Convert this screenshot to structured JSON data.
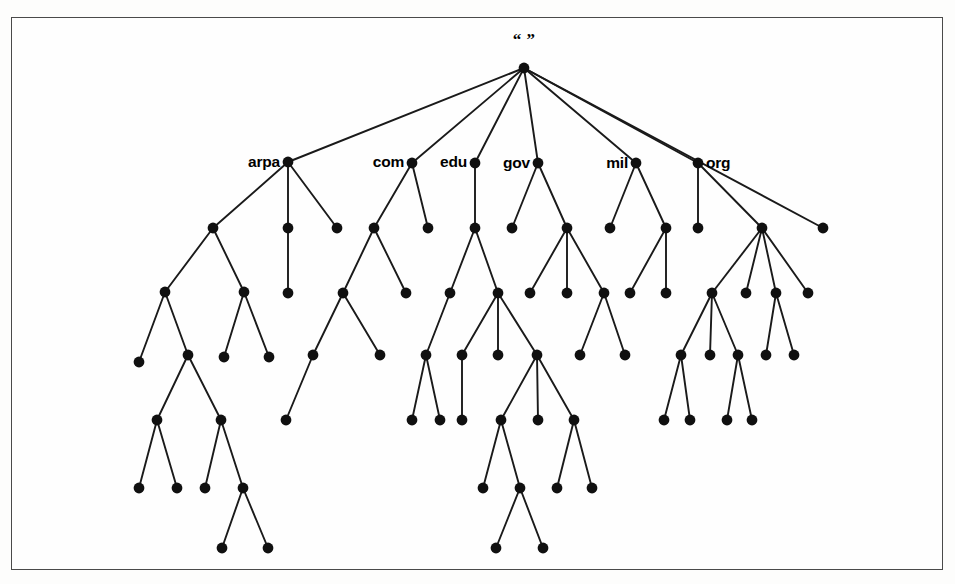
{
  "figure": {
    "root_label": "“ ”",
    "node_radius": 5.4,
    "node_color": "#101010",
    "edge_color": "#1a1a1a",
    "frame_color": "#4a4a4a",
    "background": "#fefefe"
  },
  "labels": [
    {
      "text": "arpa",
      "x": 280,
      "y": 167,
      "anchor": "end",
      "node": "tld-arpa"
    },
    {
      "text": "com",
      "x": 404,
      "y": 167,
      "anchor": "end",
      "node": "tld-com"
    },
    {
      "text": "edu",
      "x": 467,
      "y": 167,
      "anchor": "end",
      "node": "tld-edu"
    },
    {
      "text": "gov",
      "x": 530,
      "y": 168,
      "anchor": "end",
      "node": "tld-gov"
    },
    {
      "text": "mil",
      "x": 628,
      "y": 168,
      "anchor": "end",
      "node": "tld-mil"
    },
    {
      "text": "org",
      "x": 706,
      "y": 168,
      "anchor": "start",
      "node": "tld-org"
    }
  ],
  "root_label_pos": {
    "x": 524,
    "y": 45
  },
  "nodes": [
    {
      "id": "root",
      "x": 524,
      "y": 68,
      "name": "root-node"
    },
    {
      "id": "arpa",
      "x": 288,
      "y": 162,
      "name": "tld-arpa"
    },
    {
      "id": "com",
      "x": 412,
      "y": 163,
      "name": "tld-com"
    },
    {
      "id": "edu",
      "x": 475,
      "y": 163,
      "name": "tld-edu"
    },
    {
      "id": "gov",
      "x": 538,
      "y": 163,
      "name": "tld-gov"
    },
    {
      "id": "mil",
      "x": 636,
      "y": 163,
      "name": "tld-mil"
    },
    {
      "id": "org",
      "x": 698,
      "y": 163,
      "name": "tld-org"
    },
    {
      "id": "a1",
      "x": 213,
      "y": 228,
      "name": "tree-node"
    },
    {
      "id": "a2",
      "x": 288,
      "y": 228,
      "name": "tree-node"
    },
    {
      "id": "a3",
      "x": 337,
      "y": 228,
      "name": "tree-node"
    },
    {
      "id": "c1",
      "x": 374,
      "y": 228,
      "name": "tree-node"
    },
    {
      "id": "c2",
      "x": 428,
      "y": 228,
      "name": "tree-node"
    },
    {
      "id": "e1",
      "x": 475,
      "y": 228,
      "name": "tree-node"
    },
    {
      "id": "g1",
      "x": 512,
      "y": 228,
      "name": "tree-node"
    },
    {
      "id": "g2",
      "x": 567,
      "y": 228,
      "name": "tree-node"
    },
    {
      "id": "m1",
      "x": 610,
      "y": 228,
      "name": "tree-node"
    },
    {
      "id": "m2",
      "x": 666,
      "y": 228,
      "name": "tree-node"
    },
    {
      "id": "o1",
      "x": 698,
      "y": 228,
      "name": "tree-node"
    },
    {
      "id": "o2",
      "x": 762,
      "y": 228,
      "name": "tree-node"
    },
    {
      "id": "o3",
      "x": 823,
      "y": 228,
      "name": "tree-node"
    },
    {
      "id": "b1",
      "x": 165,
      "y": 292,
      "name": "tree-node"
    },
    {
      "id": "b2",
      "x": 244,
      "y": 292,
      "name": "tree-node"
    },
    {
      "id": "b3",
      "x": 288,
      "y": 293,
      "name": "tree-node"
    },
    {
      "id": "b4",
      "x": 343,
      "y": 293,
      "name": "tree-node"
    },
    {
      "id": "b5",
      "x": 406,
      "y": 293,
      "name": "tree-node"
    },
    {
      "id": "b6",
      "x": 450,
      "y": 293,
      "name": "tree-node"
    },
    {
      "id": "b7",
      "x": 498,
      "y": 293,
      "name": "tree-node"
    },
    {
      "id": "b8",
      "x": 530,
      "y": 293,
      "name": "tree-node"
    },
    {
      "id": "b9",
      "x": 567,
      "y": 293,
      "name": "tree-node"
    },
    {
      "id": "b10",
      "x": 604,
      "y": 293,
      "name": "tree-node"
    },
    {
      "id": "b11",
      "x": 630,
      "y": 293,
      "name": "tree-node"
    },
    {
      "id": "b12",
      "x": 666,
      "y": 293,
      "name": "tree-node"
    },
    {
      "id": "b13",
      "x": 712,
      "y": 293,
      "name": "tree-node"
    },
    {
      "id": "b14",
      "x": 746,
      "y": 293,
      "name": "tree-node"
    },
    {
      "id": "b15",
      "x": 776,
      "y": 293,
      "name": "tree-node"
    },
    {
      "id": "b16",
      "x": 808,
      "y": 293,
      "name": "tree-node"
    },
    {
      "id": "d1",
      "x": 139,
      "y": 362,
      "name": "tree-node"
    },
    {
      "id": "d2",
      "x": 188,
      "y": 355,
      "name": "tree-node"
    },
    {
      "id": "d3",
      "x": 224,
      "y": 357,
      "name": "tree-node"
    },
    {
      "id": "d4",
      "x": 269,
      "y": 357,
      "name": "tree-node"
    },
    {
      "id": "d5",
      "x": 313,
      "y": 355,
      "name": "tree-node"
    },
    {
      "id": "d6",
      "x": 380,
      "y": 355,
      "name": "tree-node"
    },
    {
      "id": "d7",
      "x": 426,
      "y": 355,
      "name": "tree-node"
    },
    {
      "id": "d8",
      "x": 462,
      "y": 355,
      "name": "tree-node"
    },
    {
      "id": "d9",
      "x": 498,
      "y": 355,
      "name": "tree-node"
    },
    {
      "id": "d10",
      "x": 537,
      "y": 355,
      "name": "tree-node"
    },
    {
      "id": "d11",
      "x": 580,
      "y": 355,
      "name": "tree-node"
    },
    {
      "id": "d12",
      "x": 625,
      "y": 355,
      "name": "tree-node"
    },
    {
      "id": "d13",
      "x": 681,
      "y": 355,
      "name": "tree-node"
    },
    {
      "id": "d14",
      "x": 710,
      "y": 355,
      "name": "tree-node"
    },
    {
      "id": "d15",
      "x": 738,
      "y": 355,
      "name": "tree-node"
    },
    {
      "id": "d16",
      "x": 766,
      "y": 355,
      "name": "tree-node"
    },
    {
      "id": "d17",
      "x": 794,
      "y": 355,
      "name": "tree-node"
    },
    {
      "id": "f1",
      "x": 157,
      "y": 420,
      "name": "tree-node"
    },
    {
      "id": "f2",
      "x": 221,
      "y": 420,
      "name": "tree-node"
    },
    {
      "id": "f3",
      "x": 286,
      "y": 420,
      "name": "tree-node"
    },
    {
      "id": "f4",
      "x": 412,
      "y": 420,
      "name": "tree-node"
    },
    {
      "id": "f5",
      "x": 440,
      "y": 420,
      "name": "tree-node"
    },
    {
      "id": "f6",
      "x": 462,
      "y": 420,
      "name": "tree-node"
    },
    {
      "id": "f7",
      "x": 501,
      "y": 420,
      "name": "tree-node"
    },
    {
      "id": "f8",
      "x": 538,
      "y": 420,
      "name": "tree-node"
    },
    {
      "id": "f9",
      "x": 574,
      "y": 420,
      "name": "tree-node"
    },
    {
      "id": "f10",
      "x": 664,
      "y": 420,
      "name": "tree-node"
    },
    {
      "id": "f11",
      "x": 690,
      "y": 420,
      "name": "tree-node"
    },
    {
      "id": "f12",
      "x": 727,
      "y": 420,
      "name": "tree-node"
    },
    {
      "id": "f13",
      "x": 752,
      "y": 420,
      "name": "tree-node"
    },
    {
      "id": "h1",
      "x": 139,
      "y": 488,
      "name": "tree-node"
    },
    {
      "id": "h2",
      "x": 177,
      "y": 488,
      "name": "tree-node"
    },
    {
      "id": "h3",
      "x": 205,
      "y": 488,
      "name": "tree-node"
    },
    {
      "id": "h4",
      "x": 243,
      "y": 488,
      "name": "tree-node"
    },
    {
      "id": "h5",
      "x": 483,
      "y": 488,
      "name": "tree-node"
    },
    {
      "id": "h6",
      "x": 520,
      "y": 488,
      "name": "tree-node"
    },
    {
      "id": "h7",
      "x": 557,
      "y": 488,
      "name": "tree-node"
    },
    {
      "id": "h8",
      "x": 592,
      "y": 488,
      "name": "tree-node"
    },
    {
      "id": "k1",
      "x": 222,
      "y": 548,
      "name": "tree-node"
    },
    {
      "id": "k2",
      "x": 268,
      "y": 548,
      "name": "tree-node"
    },
    {
      "id": "k3",
      "x": 496,
      "y": 548,
      "name": "tree-node"
    },
    {
      "id": "k4",
      "x": 543,
      "y": 548,
      "name": "tree-node"
    }
  ],
  "edges": [
    [
      "root",
      "arpa"
    ],
    [
      "root",
      "com"
    ],
    [
      "root",
      "edu"
    ],
    [
      "root",
      "gov"
    ],
    [
      "root",
      "mil"
    ],
    [
      "root",
      "org"
    ],
    [
      "root",
      "o3"
    ],
    [
      "arpa",
      "a1"
    ],
    [
      "arpa",
      "a2"
    ],
    [
      "arpa",
      "a3"
    ],
    [
      "com",
      "c1"
    ],
    [
      "com",
      "c2"
    ],
    [
      "edu",
      "e1"
    ],
    [
      "gov",
      "g1"
    ],
    [
      "gov",
      "g2"
    ],
    [
      "mil",
      "m1"
    ],
    [
      "mil",
      "m2"
    ],
    [
      "org",
      "o1"
    ],
    [
      "org",
      "o2"
    ],
    [
      "a1",
      "b1"
    ],
    [
      "a1",
      "b2"
    ],
    [
      "a2",
      "b3"
    ],
    [
      "c1",
      "b4"
    ],
    [
      "c1",
      "b5"
    ],
    [
      "e1",
      "b6"
    ],
    [
      "e1",
      "b7"
    ],
    [
      "g2",
      "b8"
    ],
    [
      "g2",
      "b9"
    ],
    [
      "g2",
      "b10"
    ],
    [
      "m2",
      "b11"
    ],
    [
      "m2",
      "b12"
    ],
    [
      "o2",
      "b13"
    ],
    [
      "o2",
      "b14"
    ],
    [
      "o2",
      "b15"
    ],
    [
      "o2",
      "b16"
    ],
    [
      "b1",
      "d1"
    ],
    [
      "b1",
      "d2"
    ],
    [
      "b2",
      "d3"
    ],
    [
      "b2",
      "d4"
    ],
    [
      "b4",
      "d5"
    ],
    [
      "b4",
      "d6"
    ],
    [
      "b6",
      "d7"
    ],
    [
      "b7",
      "d8"
    ],
    [
      "b7",
      "d9"
    ],
    [
      "b7",
      "d10"
    ],
    [
      "b10",
      "d11"
    ],
    [
      "b10",
      "d12"
    ],
    [
      "b13",
      "d13"
    ],
    [
      "b13",
      "d14"
    ],
    [
      "b13",
      "d15"
    ],
    [
      "b15",
      "d16"
    ],
    [
      "b15",
      "d17"
    ],
    [
      "d2",
      "f1"
    ],
    [
      "d2",
      "f2"
    ],
    [
      "d5",
      "f3"
    ],
    [
      "d7",
      "f4"
    ],
    [
      "d7",
      "f5"
    ],
    [
      "d8",
      "f6"
    ],
    [
      "d10",
      "f7"
    ],
    [
      "d10",
      "f8"
    ],
    [
      "d10",
      "f9"
    ],
    [
      "d13",
      "f10"
    ],
    [
      "d13",
      "f11"
    ],
    [
      "d15",
      "f12"
    ],
    [
      "d15",
      "f13"
    ],
    [
      "f1",
      "h1"
    ],
    [
      "f1",
      "h2"
    ],
    [
      "f2",
      "h3"
    ],
    [
      "f2",
      "h4"
    ],
    [
      "f7",
      "h5"
    ],
    [
      "f7",
      "h6"
    ],
    [
      "f9",
      "h7"
    ],
    [
      "f9",
      "h8"
    ],
    [
      "h4",
      "k1"
    ],
    [
      "h4",
      "k2"
    ],
    [
      "h6",
      "k3"
    ],
    [
      "h6",
      "k4"
    ]
  ]
}
